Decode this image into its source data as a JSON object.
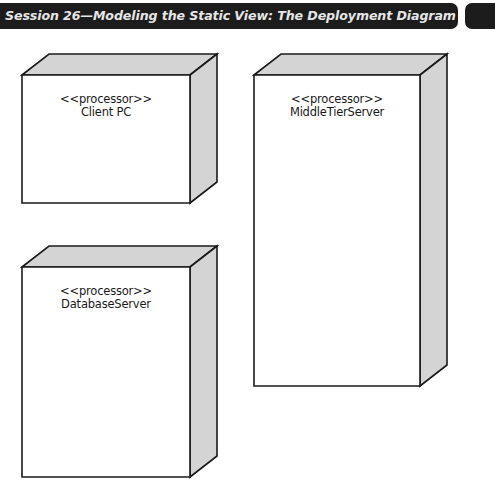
{
  "header": {
    "title": "Session 26—Modeling the Static View: The Deployment Diagram",
    "bar_color": "#1c1c1c",
    "text_color": "#e6e6e6"
  },
  "diagram": {
    "type": "UML deployment diagram",
    "colors": {
      "front_face": "#ffffff",
      "side_faces": "#d4d4d4",
      "stroke": "#1a1a1a"
    },
    "nodes": [
      {
        "id": "client-pc",
        "stereotype": "<<processor>>",
        "name": "Client PC",
        "front": {
          "x": 22,
          "y": 75,
          "w": 168,
          "h": 128
        },
        "depth": {
          "dx": 27,
          "dy": -21
        }
      },
      {
        "id": "middle-tier-server",
        "stereotype": "<<processor>>",
        "name": "MiddleTierServer",
        "front": {
          "x": 254,
          "y": 75,
          "w": 166,
          "h": 311
        },
        "depth": {
          "dx": 27,
          "dy": -21
        }
      },
      {
        "id": "database-server",
        "stereotype": "<<processor>>",
        "name": "DatabaseServer",
        "front": {
          "x": 22,
          "y": 267,
          "w": 168,
          "h": 210
        },
        "depth": {
          "dx": 27,
          "dy": -21
        }
      }
    ]
  }
}
